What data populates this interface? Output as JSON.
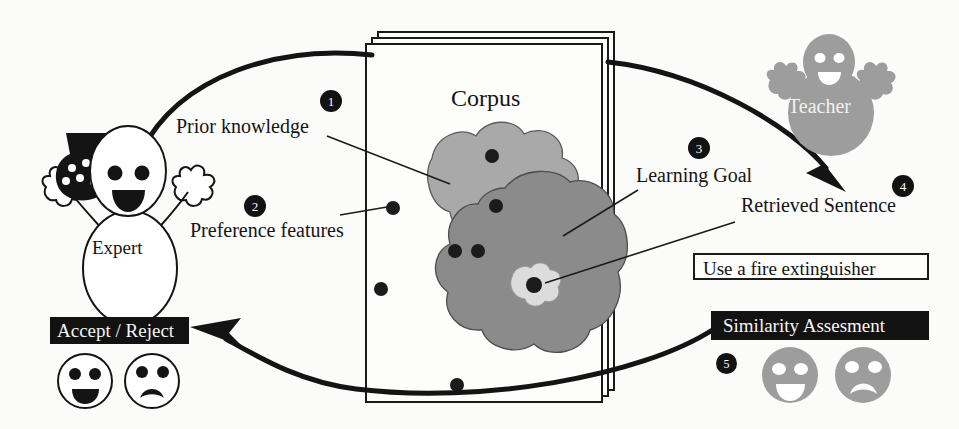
{
  "diagram": {
    "colors": {
      "ink": "#121212",
      "paper": "#fbfbfa",
      "blob_light": "#a8a8a8",
      "blob_dark": "#8b8b8b",
      "inner_region": "#d8d8d8",
      "teacher_gray": "#9d9d9d",
      "face_gray": "#9d9d9d"
    },
    "actors": {
      "expert": {
        "label": "Expert",
        "icon": "expert-person-icon"
      },
      "teacher": {
        "label": "Teacher",
        "icon": "teacher-person-icon"
      }
    },
    "corpus": {
      "title": "Corpus",
      "icon": "document-stack-icon",
      "regions": [
        {
          "name": "prior-knowledge-region",
          "shade": "#a8a8a8"
        },
        {
          "name": "learning-goal-region",
          "shade": "#8b8b8b"
        },
        {
          "name": "retrieved-sentence-region",
          "shade": "#d8d8d8"
        }
      ],
      "point_count": 9
    },
    "labels": {
      "prior_knowledge": "Prior knowledge",
      "preference_features": "Preference features",
      "learning_goal": "Learning Goal",
      "retrieved_sentence": "Retrieved Sentence"
    },
    "badges": [
      {
        "id": "badge-1",
        "number": "1"
      },
      {
        "id": "badge-2",
        "number": "2"
      },
      {
        "id": "badge-3",
        "number": "3"
      },
      {
        "id": "badge-4",
        "number": "4"
      },
      {
        "id": "badge-5",
        "number": "5"
      }
    ],
    "sentence_box": {
      "text": "Use a fire extinguisher"
    },
    "decision_box": {
      "text": "Accept / Reject"
    },
    "assessment_box": {
      "text": "Similarity Assesment"
    },
    "faces": {
      "expert_positive": "happy-face-icon",
      "expert_negative": "sad-face-icon",
      "teacher_positive": "happy-face-icon",
      "teacher_negative": "sad-face-icon"
    }
  }
}
